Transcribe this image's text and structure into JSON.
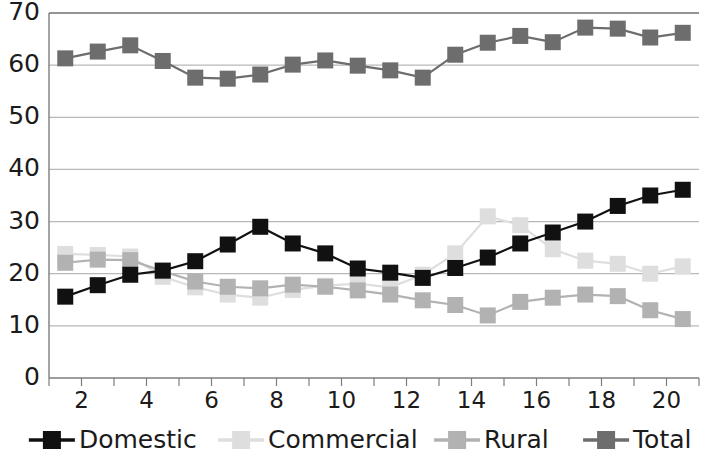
{
  "chart_data": {
    "type": "line",
    "title": "",
    "xlabel": "",
    "ylabel": "",
    "xlim": [
      1,
      21
    ],
    "ylim": [
      0,
      70
    ],
    "grid": true,
    "legend_position": "bottom",
    "y_ticks": [
      0,
      10,
      20,
      30,
      40,
      50,
      60,
      70
    ],
    "x_ticks": [
      2,
      4,
      6,
      8,
      10,
      12,
      14,
      16,
      18,
      20
    ],
    "x_minor_ticks": [
      1,
      2,
      3,
      4,
      5,
      6,
      7,
      8,
      9,
      10,
      11,
      12,
      13,
      14,
      15,
      16,
      17,
      18,
      19,
      20,
      21
    ],
    "x": [
      1.5,
      2.5,
      3.5,
      4.5,
      5.5,
      6.5,
      7.5,
      8.5,
      9.5,
      10.5,
      11.5,
      12.5,
      13.5,
      14.5,
      15.5,
      16.5,
      17.5,
      18.5,
      19.5,
      20.5
    ],
    "series": [
      {
        "name": "Domestic",
        "color": "#111111",
        "marker": "square",
        "values": [
          15.6,
          17.8,
          19.8,
          20.6,
          22.4,
          25.6,
          29.0,
          25.8,
          23.9,
          21.0,
          20.2,
          19.2,
          21.1,
          23.1,
          25.8,
          27.9,
          30.0,
          33.0,
          35.0,
          36.1
        ]
      },
      {
        "name": "Commercial",
        "color": "#dedede",
        "marker": "square",
        "values": [
          23.8,
          23.6,
          23.3,
          19.4,
          17.4,
          16.0,
          15.4,
          16.9,
          17.7,
          18.1,
          17.4,
          19.8,
          23.9,
          31.0,
          29.3,
          24.7,
          22.5,
          21.9,
          20.0,
          21.4
        ]
      },
      {
        "name": "Rural",
        "color": "#b2b2b2",
        "marker": "square",
        "values": [
          22.1,
          22.7,
          22.6,
          20.5,
          18.5,
          17.5,
          17.2,
          17.9,
          17.5,
          16.8,
          16.0,
          14.9,
          14.0,
          12.0,
          14.6,
          15.4,
          16.0,
          15.7,
          13.0,
          11.3
        ]
      },
      {
        "name": "Total",
        "color": "#6d6d6d",
        "marker": "square",
        "values": [
          61.3,
          62.6,
          63.8,
          60.8,
          57.6,
          57.4,
          58.2,
          60.1,
          60.9,
          59.9,
          59.0,
          57.6,
          62.0,
          64.3,
          65.6,
          64.4,
          67.2,
          67.0,
          65.3,
          66.2
        ]
      }
    ]
  },
  "legend": {
    "items": [
      {
        "label": "Domestic",
        "color": "#111111"
      },
      {
        "label": "Commercial",
        "color": "#dedede"
      },
      {
        "label": "Rural",
        "color": "#b2b2b2"
      },
      {
        "label": "Total",
        "color": "#6d6d6d"
      }
    ]
  }
}
